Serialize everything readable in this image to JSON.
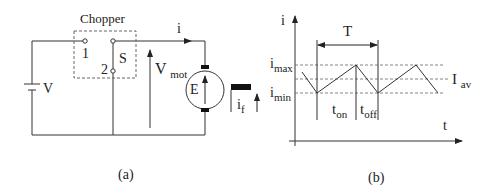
{
  "diagram_a": {
    "caption": "(a)",
    "chopper_label": "Chopper",
    "terminal_1": "1",
    "terminal_2": "2",
    "switch_label": "S",
    "current_label": "i",
    "battery_label": "V",
    "motor_voltage": {
      "main": "V",
      "sub": "mot"
    },
    "emf_label": "E",
    "field_current": {
      "main": "i",
      "sub": "f"
    }
  },
  "diagram_b": {
    "caption": "(b)",
    "y_axis_label": "i",
    "x_axis_label": "t",
    "period_label": "T",
    "i_max": {
      "main": "i",
      "sub": "max"
    },
    "i_min": {
      "main": "i",
      "sub": "min"
    },
    "i_av": {
      "main": "I",
      "sub": "av"
    },
    "t_on": {
      "main": "t",
      "sub": "on"
    },
    "t_off": {
      "main": "t",
      "sub": "off"
    }
  },
  "colors": {
    "line": "#333333",
    "dashed": "#666666",
    "fill": "#111111"
  }
}
